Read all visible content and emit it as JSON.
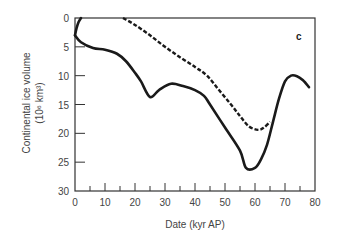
{
  "chart_data": {
    "type": "line",
    "title": "",
    "panel_label": "c",
    "xlabel": "Date (kyr AP)",
    "ylabel_line1": "Continental ice volume",
    "ylabel_line2": "(10⁶ km³)",
    "xlim": [
      0,
      80
    ],
    "ylim": [
      30,
      0
    ],
    "y_inverted": true,
    "x_ticks": [
      0,
      10,
      20,
      30,
      40,
      50,
      60,
      70,
      80
    ],
    "y_ticks": [
      0,
      5,
      10,
      15,
      20,
      25,
      30
    ],
    "grid": false,
    "legend": null,
    "series": [
      {
        "name": "solid",
        "style": "solid",
        "x": [
          0,
          2,
          6,
          10,
          14,
          17,
          20,
          22,
          25,
          28,
          32,
          36,
          40,
          43,
          45,
          50,
          55,
          57,
          60,
          62,
          64,
          66,
          68,
          70,
          72,
          74,
          76,
          78
        ],
        "y": [
          3,
          4.2,
          5.2,
          5.5,
          6.2,
          7.5,
          9.5,
          11,
          13.7,
          12.5,
          11.4,
          11.8,
          12.5,
          13.5,
          15,
          19,
          23,
          26,
          26,
          24.5,
          22,
          18,
          14,
          11,
          10,
          10.1,
          10.8,
          12
        ]
      },
      {
        "name": "solid-early-branch",
        "style": "solid",
        "x": [
          0,
          0.5,
          1.2,
          2
        ],
        "y": [
          3,
          1.8,
          0.7,
          0
        ]
      },
      {
        "name": "dashed",
        "style": "dashed",
        "x": [
          16,
          20,
          25,
          30,
          35,
          40,
          44,
          48,
          52,
          55,
          58,
          61,
          63,
          65
        ],
        "y": [
          0,
          1.2,
          3,
          5,
          6.8,
          8.5,
          10,
          12.5,
          15,
          17,
          18.8,
          19.4,
          19,
          18
        ]
      }
    ]
  }
}
